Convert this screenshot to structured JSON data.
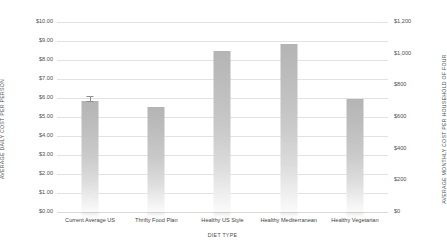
{
  "chart_data": {
    "type": "bar",
    "title": "",
    "xlabel": "DIET TYPE",
    "ylabel": "AVERAGE DAILY COST PER PERSON",
    "y2label": "AVERAGE MONTHLY COST PER HOUSEHOLD OF FOUR",
    "categories": [
      "Current Average US",
      "Thrifty Food Plan",
      "Healthy US Style",
      "Healthy Mediterranean",
      "Healthy Vegetarian"
    ],
    "values": [
      5.85,
      5.55,
      8.45,
      8.85,
      5.95
    ],
    "errors": [
      {
        "category": "Current Average US",
        "plus": 0.28,
        "minus": 0.05
      }
    ],
    "ylim": [
      0,
      10
    ],
    "y2lim": [
      0,
      1200
    ],
    "yticks": [
      0,
      1,
      2,
      3,
      4,
      5,
      6,
      7,
      8,
      9,
      10
    ],
    "ytick_labels": [
      "$0.00",
      "$1.00",
      "$2.00",
      "$3.00",
      "$4.00",
      "$5.00",
      "$6.00",
      "$7.00",
      "$8.00",
      "$9.00",
      "$10.00"
    ],
    "y2ticks": [
      0,
      200,
      400,
      600,
      800,
      1000,
      1200
    ],
    "y2tick_labels": [
      "$0",
      "$200",
      "$400",
      "$600",
      "$800",
      "$1,000",
      "$1,200"
    ],
    "grid": true,
    "legend": false,
    "bar_color": "#bdbdbd",
    "grid_color": "#e2e2e2",
    "text_color": "#4a4a4a"
  }
}
